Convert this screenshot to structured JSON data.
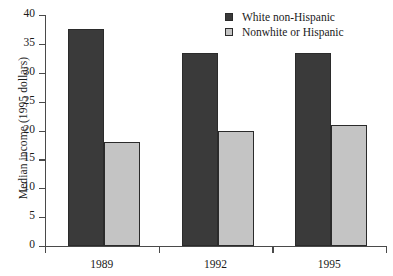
{
  "chart_data": {
    "type": "bar",
    "title": "",
    "xlabel": "",
    "ylabel": "Median income (1995 dollars)",
    "categories": [
      "1989",
      "1992",
      "1995"
    ],
    "series": [
      {
        "name": "White non-Hispanic",
        "color": "#3a3a3a",
        "values": [
          37.5,
          33.5,
          33.5
        ]
      },
      {
        "name": "Nonwhite or Hispanic",
        "color": "#c4c4c4",
        "values": [
          18.0,
          20.0,
          21.0
        ]
      }
    ],
    "ylim": [
      0,
      40
    ],
    "yticks": [
      0,
      5,
      10,
      15,
      20,
      25,
      30,
      35,
      40
    ],
    "ytick_labels": [
      "0",
      "5",
      "10",
      "15",
      "20",
      "25",
      "30",
      "35",
      "40"
    ],
    "grid": false,
    "legend_position": "top-right"
  }
}
